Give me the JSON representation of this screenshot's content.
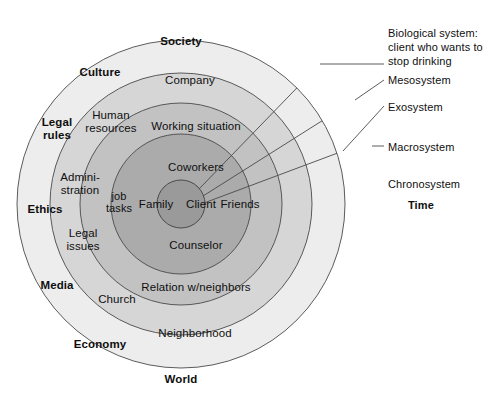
{
  "figure": {
    "background": "#ffffff"
  },
  "rings": [
    {
      "id": "macrosystem",
      "label": "Society",
      "fill": "#ededed",
      "outer_r": 164,
      "side_label": "Macrosystem"
    },
    {
      "id": "exosystem",
      "label": "Company",
      "fill": "#d6d6d6",
      "outer_r": 131,
      "side_label": "Exosystem"
    },
    {
      "id": "mesosystem",
      "label": "Working situation",
      "fill": "#c2c2c2",
      "outer_r": 101,
      "side_label": "Mesosystem"
    },
    {
      "id": "microsystem",
      "label": "Coworkers",
      "fill": "#ababab",
      "outer_r": 70,
      "side_label": ""
    },
    {
      "id": "biological-system",
      "label": "Client",
      "fill": "#9a9a9a",
      "outer_r": 24,
      "side_label": "Biological system: client who wants to stop drinking"
    }
  ],
  "ring_labels": {
    "outer_ring": {
      "top": "Society",
      "bottom": "World",
      "upper_left": "Culture",
      "left_upper": "Legal\nrules",
      "left": "Ethics",
      "left_lower": "Media",
      "lower_left": "Economy"
    },
    "second_ring": {
      "top": "Company",
      "upper_left": "Human\nresources",
      "left_upper": "Admini-\nstration",
      "left_lower": "Legal\nissues",
      "lower_left": "Church",
      "bottom": "Neighborhood"
    },
    "third_ring": {
      "top": "Working situation",
      "left": "job\ntasks",
      "bottom": "Relation w/neighbors"
    },
    "fourth_ring": {
      "top": "Coworkers",
      "left": "Family",
      "right": "Friends",
      "bottom": "Counselor"
    },
    "core": {
      "label": "Client"
    }
  },
  "side_annotations": [
    {
      "id": "biological",
      "lines": "Biological system:\nclient who wants to\nstop drinking",
      "bold": false,
      "x": 388,
      "y": 26,
      "leader": true
    },
    {
      "id": "mesosystem",
      "lines": "Mesosystem",
      "bold": false,
      "x": 388,
      "y": 73,
      "leader": true
    },
    {
      "id": "exosystem",
      "lines": "Exosystem",
      "bold": false,
      "x": 388,
      "y": 100,
      "leader": true
    },
    {
      "id": "macrosystem",
      "lines": "Macrosystem",
      "bold": false,
      "x": 388,
      "y": 140,
      "leader": true
    },
    {
      "id": "chronosystem",
      "lines": "Chronosystem",
      "bold": false,
      "x": 388,
      "y": 177,
      "leader": false
    },
    {
      "id": "time",
      "lines": "Time",
      "bold": true,
      "x": 408,
      "y": 198,
      "leader": false
    }
  ],
  "geometry": {
    "cx": 181,
    "cy": 204,
    "stroke": "#4a4a4a",
    "stroke_width": 0.9
  }
}
